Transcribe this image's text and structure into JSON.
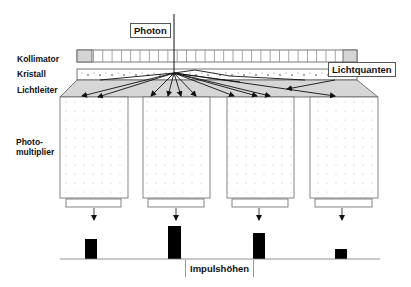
{
  "labels": {
    "photon": "Photon",
    "collimator": "Kollimator",
    "crystal": "Kristall",
    "lightguide": "Lichtleiter",
    "light_quanta": "Lichtquanten",
    "pmt_line1": "Photo-",
    "pmt_line2": "multiplier",
    "pulse_heights": "Impulshöhen"
  },
  "colors": {
    "stroke": "#555555",
    "dark": "#111111",
    "collimator_cap": "#d4d4d4",
    "lightguide_fill": "#d6d6d6",
    "bar": "#000000"
  },
  "photomultipliers": [
    {
      "x": 60,
      "width": 68,
      "pulse_height": 20
    },
    {
      "x": 143,
      "width": 67,
      "pulse_height": 33
    },
    {
      "x": 227,
      "width": 67,
      "pulse_height": 26
    },
    {
      "x": 310,
      "width": 68,
      "pulse_height": 10
    }
  ]
}
